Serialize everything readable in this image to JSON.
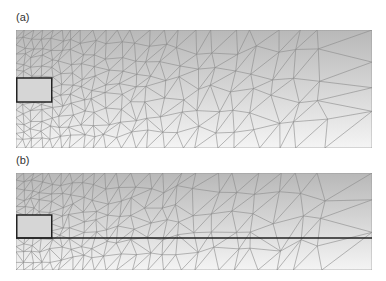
{
  "figure": {
    "panels": [
      {
        "id": "a",
        "label": "(a)",
        "x": 16,
        "y": 30,
        "width": 356,
        "height": 118,
        "rect": {
          "x": 0,
          "y": 48,
          "width": 35,
          "height": 24
        },
        "interface_line": null
      },
      {
        "id": "b",
        "label": "(b)",
        "x": 16,
        "y": 173,
        "width": 356,
        "height": 97,
        "rect": {
          "x": 0,
          "y": 42,
          "width": 35,
          "height": 23
        },
        "interface_line": {
          "y": 65
        }
      }
    ],
    "colors": {
      "gradient_top": "#b8b8b8",
      "gradient_bottom": "#f4f4f4",
      "mesh_line": "#8a8a8a",
      "outline": "#222222",
      "rect_fill": "#d6d6d6"
    }
  }
}
